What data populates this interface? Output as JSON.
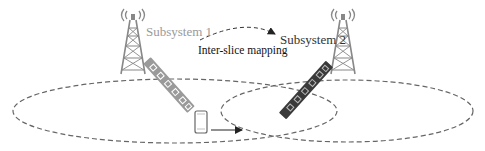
{
  "diagram": {
    "labels": {
      "subsystem1": "Subsystem 1",
      "subsystem2": "Subsystem 2",
      "mapping": "Inter-slice mapping"
    },
    "colors": {
      "tower": "#8a8a8a",
      "array1": "#9a9a9a",
      "array2": "#3a3a3a",
      "ellipse": "#666666",
      "arrow": "#222222"
    },
    "nodes": [
      {
        "id": "tower-1",
        "type": "base-station",
        "subsystem": 1
      },
      {
        "id": "tower-2",
        "type": "base-station",
        "subsystem": 2
      },
      {
        "id": "array-1",
        "type": "antenna-array",
        "subsystem": 1
      },
      {
        "id": "array-2",
        "type": "antenna-array",
        "subsystem": 2
      },
      {
        "id": "phone",
        "type": "user-equipment"
      }
    ],
    "edges": [
      {
        "from": "subsystem1",
        "to": "subsystem2",
        "label": "Inter-slice mapping",
        "style": "dashed-curve"
      },
      {
        "from": "phone",
        "to": "subsystem2-coverage",
        "style": "solid-arrow"
      }
    ],
    "coverage_areas": [
      {
        "id": "coverage-1",
        "shape": "dashed-ellipse"
      },
      {
        "id": "coverage-2",
        "shape": "dashed-ellipse"
      }
    ]
  }
}
